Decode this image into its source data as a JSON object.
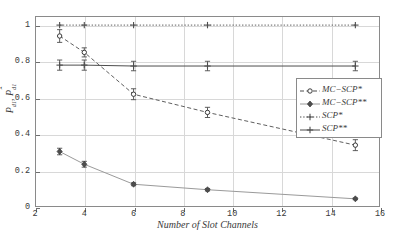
{
  "chart_data": {
    "type": "line",
    "title": "",
    "xlabel": "Number of Slot Channels",
    "ylabel_main": "P",
    "ylabel_sub1": "d1",
    "ylabel_hat": "P",
    "ylabel_sub2": "d1",
    "xlim": [
      2,
      16
    ],
    "ylim": [
      0,
      1.05
    ],
    "xticks": [
      2,
      4,
      6,
      8,
      10,
      12,
      14,
      16
    ],
    "yticks": [
      0,
      0.2,
      0.4,
      0.6,
      0.8,
      1
    ],
    "xticklabels": [
      "2",
      "4",
      "6",
      "8",
      "10",
      "12",
      "14",
      "16"
    ],
    "yticklabels": [
      "0",
      "0.2",
      "0.4",
      "0.6",
      "0.8",
      "1"
    ],
    "grid": true,
    "legend_position": "right-middle",
    "x": [
      3,
      4,
      6,
      9,
      15
    ],
    "series": [
      {
        "name": "MC-SCP*",
        "values": [
          0.94,
          0.85,
          0.62,
          0.52,
          0.34
        ],
        "errors": [
          0.035,
          0.025,
          0.03,
          0.028,
          0.03
        ],
        "linestyle": "dashed",
        "marker": "circle-open",
        "color": "#4d4d4d"
      },
      {
        "name": "MC-SCP**",
        "values": [
          0.305,
          0.235,
          0.125,
          0.095,
          0.045
        ],
        "errors": [
          0.018,
          0.016,
          0.008,
          0.007,
          0.005
        ],
        "linestyle": "solid",
        "marker": "diamond",
        "color": "#9a9a9a"
      },
      {
        "name": "SCP*",
        "values": [
          1.0,
          1.0,
          1.0,
          1.0,
          1.0
        ],
        "errors": [
          0.0,
          0.0,
          0.0,
          0.0,
          0.0
        ],
        "linestyle": "dotted",
        "marker": "plus",
        "color": "#4d4d4d"
      },
      {
        "name": "SCP**",
        "values": [
          0.78,
          0.78,
          0.775,
          0.775,
          0.775
        ],
        "errors": [
          0.028,
          0.028,
          0.026,
          0.026,
          0.026
        ],
        "linestyle": "solid",
        "marker": "plus",
        "color": "#4d4d4d"
      }
    ]
  },
  "legend": {
    "items": [
      {
        "label": "MC−SCP*"
      },
      {
        "label": "MC−SCP**"
      },
      {
        "label": "SCP*"
      },
      {
        "label": "SCP**"
      }
    ]
  }
}
